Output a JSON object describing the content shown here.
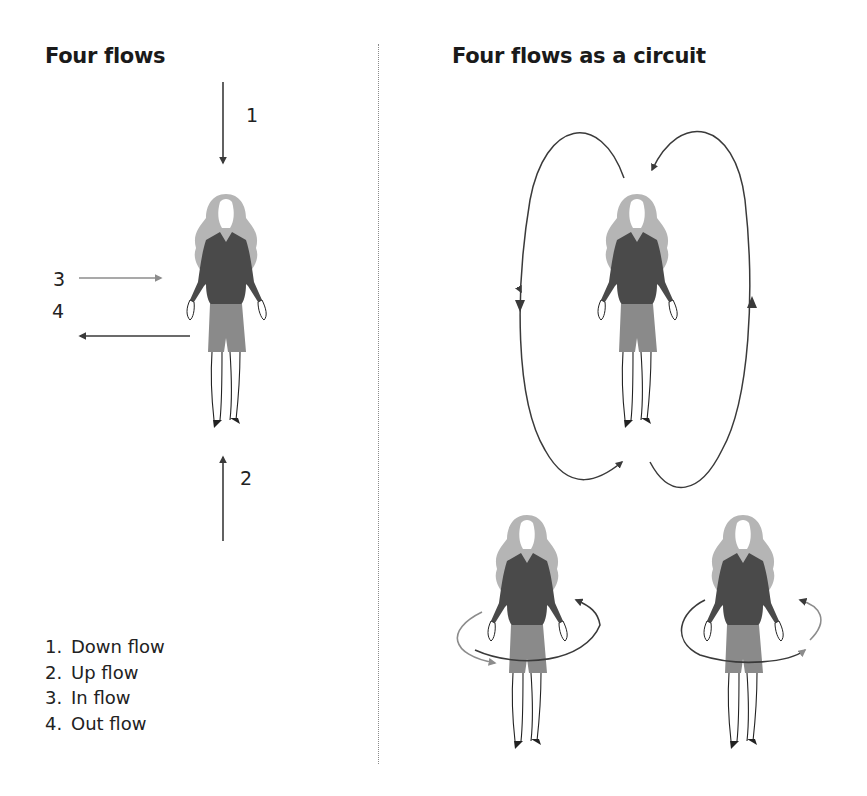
{
  "left_panel": {
    "title": "Four flows",
    "arrow_labels": {
      "down": "1",
      "up": "2",
      "in": "3",
      "out": "4"
    },
    "legend": [
      {
        "number": "1.",
        "label": "Down flow"
      },
      {
        "number": "2.",
        "label": "Up flow"
      },
      {
        "number": "3.",
        "label": "In flow"
      },
      {
        "number": "4.",
        "label": "Out flow"
      }
    ]
  },
  "right_panel": {
    "title": "Four flows as a circuit"
  },
  "colors": {
    "text": "#1a1a1a",
    "arrow_dark": "#3a3a3a",
    "arrow_light": "#8c8c8c",
    "hair": "#b5b5b5",
    "sweater": "#4a4a4a",
    "shorts": "#8a8a8a",
    "divider": "#8a8a8a"
  },
  "icons": [
    "figure-icon",
    "down-arrow-icon",
    "up-arrow-icon",
    "in-arrow-icon",
    "out-arrow-icon",
    "circuit-loop-icon",
    "rotation-loop-icon"
  ]
}
